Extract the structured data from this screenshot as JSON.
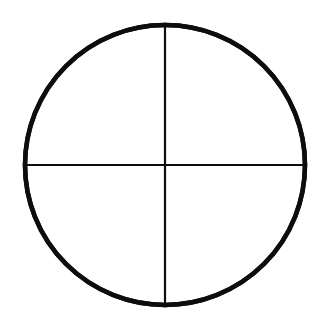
{
  "page": {
    "background_color": "#ffffff",
    "width": 327,
    "height": 323
  },
  "figure": {
    "name": "circle-with-inscribed-four-pointed-star",
    "stroke_color": "#0d0d0d",
    "fill_color": "none",
    "center": {
      "x": 165,
      "y": 165
    },
    "radius": 140,
    "cardinal_points": {
      "top": {
        "x": 165,
        "y": 25
      },
      "right": {
        "x": 305,
        "y": 165
      },
      "bottom": {
        "x": 165,
        "y": 305
      },
      "left": {
        "x": 25,
        "y": 165
      }
    },
    "elements": [
      {
        "id": "outer-circle",
        "label": "Outer circle",
        "type": "circle",
        "cx": 165,
        "cy": 165,
        "r": 140,
        "stroke_width": 4.6
      },
      {
        "id": "vertical-diameter",
        "label": "Vertical diameter",
        "type": "line",
        "x1": 165,
        "y1": 25,
        "x2": 165,
        "y2": 305,
        "stroke_width": 2.2
      },
      {
        "id": "horizontal-diameter",
        "label": "Horizontal diameter",
        "type": "line",
        "x1": 25,
        "y1": 165,
        "x2": 305,
        "y2": 165,
        "stroke_width": 2.2
      },
      {
        "id": "arc-top-left",
        "label": "Top-left concave arc",
        "type": "arc",
        "from": {
          "x": 165,
          "y": 25
        },
        "to": {
          "x": 25,
          "y": 165
        },
        "arc_center": {
          "x": 25,
          "y": 25
        },
        "arc_radius": 140,
        "sweep": 0,
        "stroke_width": 4.4
      },
      {
        "id": "arc-top-right",
        "label": "Top-right concave arc",
        "type": "arc",
        "from": {
          "x": 165,
          "y": 25
        },
        "to": {
          "x": 305,
          "y": 165
        },
        "arc_center": {
          "x": 305,
          "y": 25
        },
        "arc_radius": 140,
        "sweep": 1,
        "stroke_width": 4.4
      },
      {
        "id": "arc-bottom-right",
        "label": "Bottom-right concave arc",
        "type": "arc",
        "from": {
          "x": 305,
          "y": 165
        },
        "to": {
          "x": 165,
          "y": 305
        },
        "arc_center": {
          "x": 305,
          "y": 305
        },
        "arc_radius": 140,
        "sweep": 1,
        "stroke_width": 4.4
      },
      {
        "id": "arc-bottom-left",
        "label": "Bottom-left concave arc",
        "type": "arc",
        "from": {
          "x": 165,
          "y": 305
        },
        "to": {
          "x": 25,
          "y": 165
        },
        "arc_center": {
          "x": 25,
          "y": 305
        },
        "arc_radius": 140,
        "sweep": 1,
        "stroke_width": 4.4
      }
    ],
    "paths": {
      "outer_circle": "M 25,165 A 140,140 0 1,1 305,165 A 140,140 0 1,1 25,165 Z",
      "vertical_diameter": "M 165,25 L 165,305",
      "horizontal_diameter": "M 25,165 L 305,165",
      "arc_top_left": "M 165,25 A 140,140 0 0,0 25,165",
      "arc_top_right": "M 165,25 A 140,140 0 0,1 305,165",
      "arc_bottom_right": "M 305,165 A 140,140 0 0,1 165,305",
      "arc_bottom_left": "M 165,305 A 140,140 0 0,1 25,165"
    }
  }
}
